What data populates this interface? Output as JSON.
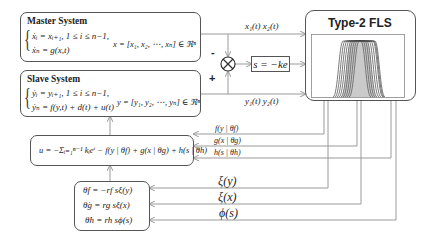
{
  "master": {
    "title": "Master System",
    "eq1": "ẋᵢ = xᵢ₊₁,  1 ≤ i ≤ n−1,",
    "eq2": "ẋₙ = g(x,t)",
    "state": "x = [x₁, x₂, ⋯, xₙ] ∈ ℜⁿ"
  },
  "slave": {
    "title": "Slave System",
    "eq1": "ẏᵢ = yᵢ₊₁,  1 ≤ i ≤ n−1,",
    "eq2": "ẏₙ = f(y,t) + d(t) + u(t)",
    "state": "y = [y₁, y₂, ⋯, yₙ] ∈ ℜⁿ"
  },
  "junction": {
    "minus": "-",
    "plus": "+",
    "symbol": "⊗"
  },
  "sliding": {
    "label": "s = −ke"
  },
  "fls": {
    "title": "Type-2 FLS",
    "plot_color": "#444444"
  },
  "signals": {
    "top": "x₁(t)  x₂(t)",
    "bottom": "y₁(t)  y₂(t)",
    "f": "f(y | θf)",
    "g": "g(x | θg)",
    "h": "h(s | θh)",
    "xi_y": "ξ(y)",
    "xi_x": "ξ(x)",
    "phi_s": "ϕ(s)"
  },
  "control": {
    "law": "u = −Σᵢ₌₁ⁿ⁻¹ kᵢeⁱ − f(y | θf) + g(x | θg) + h(s | θh)"
  },
  "adaptive": {
    "eq1": "θ̇f = −rf sξ(y)",
    "eq2": "θ̇g = rg sξ(x)",
    "eq3": "θ̇h = rh sϕ(s)"
  },
  "colors": {
    "wire": "#9a9a9a",
    "border": "#555555"
  }
}
